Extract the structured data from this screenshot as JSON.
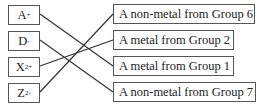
{
  "ions": [
    {
      "symbol": "A",
      "charge": "+"
    },
    {
      "symbol": "D",
      "charge": "-"
    },
    {
      "symbol": "X",
      "charge": "2+"
    },
    {
      "symbol": "Z",
      "charge": "2-"
    }
  ],
  "descriptions": [
    {
      "label": "A non-metal from Group 6"
    },
    {
      "label": "A metal from Group 2"
    },
    {
      "label": "A metal from Group 1"
    },
    {
      "label": "A non-metal from Group 7"
    }
  ],
  "connections": [
    {
      "from": "A+",
      "to": "A metal from Group 1"
    },
    {
      "from": "D-",
      "to": "A non-metal from Group 7"
    },
    {
      "from": "X2+",
      "to": "A metal from Group 2"
    },
    {
      "from": "Z2-",
      "to": "A non-metal from Group 6"
    }
  ]
}
